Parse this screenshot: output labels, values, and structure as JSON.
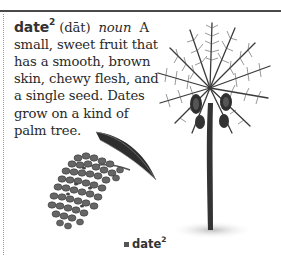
{
  "entry": {
    "headword": "date",
    "homograph": "2",
    "pronunciation": "(dāt)",
    "part_of_speech": "noun",
    "definition": "A small, sweet fruit that has a smooth, brown skin, chewy flesh, and a single seed. Dates grow on a kind of palm tree."
  },
  "illustrations": {
    "palm_tree": "palm-tree-illustration",
    "date_cluster": "date-cluster-illustration"
  },
  "caption": {
    "label": "date",
    "homograph": "2"
  },
  "colors": {
    "rule": "#4a4a4a",
    "text": "#2a2a2a"
  }
}
